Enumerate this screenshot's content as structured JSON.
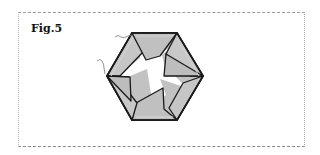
{
  "figure": {
    "label": "Fig.5",
    "colors": {
      "paper_fill": "#c2c2c2",
      "paper_fold_highlight": "#d6d6d6",
      "outline": "#1a1a1a",
      "frame_border": "#9a9a9a",
      "background": "#ffffff"
    },
    "annotations": [
      {
        "type": "leader-line",
        "target": "top-left fold"
      },
      {
        "type": "leader-line",
        "target": "left fold"
      }
    ]
  }
}
